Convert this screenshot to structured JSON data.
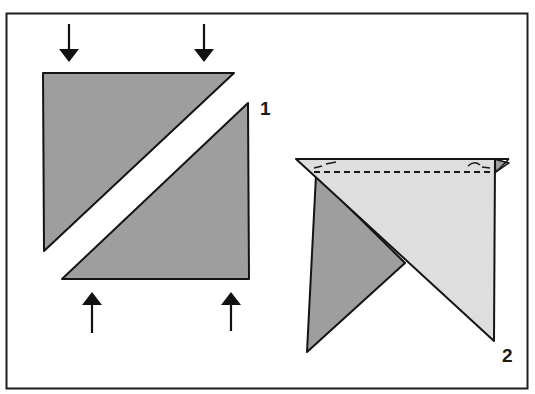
{
  "figure": {
    "colors": {
      "frame": "#1e1e1e",
      "outline": "#141414",
      "dark_fabric": "#9e9e9e",
      "light_fabric": "#dedede",
      "background": "#ffffff"
    },
    "steps": [
      {
        "number": "1",
        "caption": "Two half-square triangles pushed together along the diagonal",
        "arrows": [
          "down",
          "down",
          "up",
          "up"
        ]
      },
      {
        "number": "2",
        "caption": "Triangles placed right sides together with seam stitched along the top edge",
        "seam": "dashed"
      }
    ]
  },
  "labels": {
    "step1": "1",
    "step2": "2"
  }
}
